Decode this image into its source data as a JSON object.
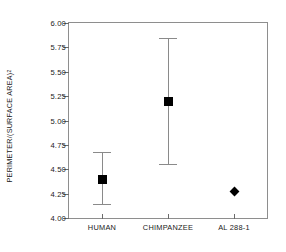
{
  "chart_data": {
    "type": "scatter",
    "title": "",
    "xlabel": "",
    "ylabel": "PERIMETER/(SURFACE AREA)",
    "ylabel_exponent": "2",
    "ylim": [
      4.0,
      6.0
    ],
    "yticks": [
      "4.00",
      "4.25",
      "4.50",
      "4.75",
      "5.00",
      "5.25",
      "5.50",
      "5.75",
      "6.00"
    ],
    "ytick_values": [
      4.0,
      4.25,
      4.5,
      4.75,
      5.0,
      5.25,
      5.5,
      5.75,
      6.0
    ],
    "grid": false,
    "legend": "none",
    "categories": [
      "HUMAN",
      "CHIMPANZEE",
      "AL 288-1"
    ],
    "series": [
      {
        "name": "mean with range",
        "marker": "square",
        "points": [
          {
            "category": "HUMAN",
            "value": 4.4,
            "low": 4.14,
            "high": 4.68,
            "marker": "square"
          },
          {
            "category": "CHIMPANZEE",
            "value": 5.2,
            "low": 4.55,
            "high": 5.85,
            "marker": "square"
          }
        ]
      },
      {
        "name": "single specimen",
        "marker": "diamond",
        "points": [
          {
            "category": "AL 288-1",
            "value": 4.27,
            "low": null,
            "high": null,
            "marker": "diamond"
          }
        ]
      }
    ],
    "colors": {
      "marker": "#000000",
      "errorbar": "#8a8a8a",
      "axis": "#8e8e8e",
      "text": "#1a1a1a",
      "background": "#ffffff"
    }
  }
}
